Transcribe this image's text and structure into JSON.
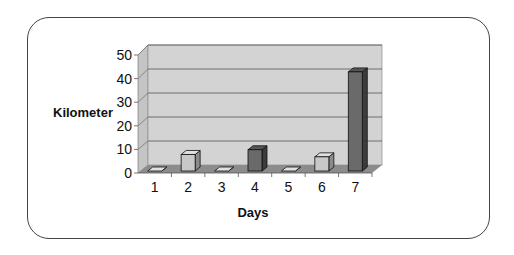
{
  "chart_data": {
    "type": "bar",
    "style": "3d-column",
    "title": "",
    "xlabel": "Days",
    "ylabel": "Kilometer",
    "categories": [
      "1",
      "2",
      "3",
      "4",
      "5",
      "6",
      "7"
    ],
    "values": [
      0,
      7,
      0,
      9,
      0,
      6,
      42
    ],
    "ylim": [
      0,
      50
    ],
    "yticks": [
      "0",
      "10",
      "20",
      "30",
      "40",
      "50"
    ],
    "grid": true,
    "legend": "none",
    "colors": {
      "light_bar": "#c8c8c8",
      "dark_bar": "#6a6a6a",
      "wall": "#d0d0d0",
      "floor": "#8a8a8a"
    }
  }
}
